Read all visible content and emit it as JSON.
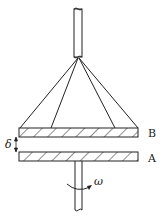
{
  "diagram": {
    "labels": {
      "upper_plate": "B",
      "lower_plate": "A",
      "gap": "δ",
      "angular_velocity": "ω"
    },
    "colors": {
      "stroke": "#222222",
      "background": "#ffffff"
    }
  }
}
